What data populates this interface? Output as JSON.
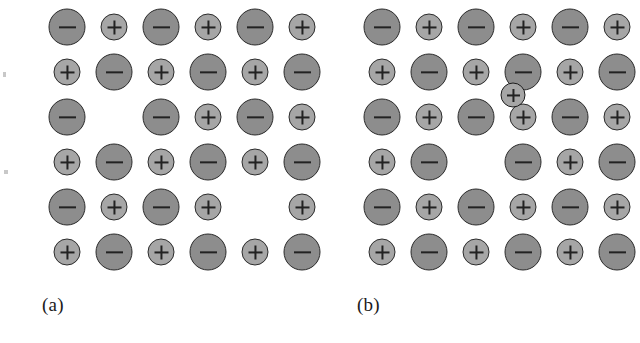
{
  "figure": {
    "background_color": "#ffffff",
    "anion_color": "#8d8d8d",
    "cation_color": "#a6a6a6",
    "outline_color": "#2b2b2b",
    "glyph_color": "#222222",
    "anion_symbol": "−",
    "cation_symbol": "+"
  },
  "panels": [
    {
      "id": "a",
      "label": "(a)",
      "columns": 6,
      "rows": 6,
      "col_step": 47,
      "row_step": 45,
      "origin_x": 31,
      "origin_y": 27,
      "rows_data": [
        [
          "-",
          "+",
          "-",
          "+",
          "-",
          "+"
        ],
        [
          "+",
          "-",
          "+",
          "-",
          "+",
          "-"
        ],
        [
          "-",
          "",
          "-",
          "+",
          "-",
          "+"
        ],
        [
          "+",
          "-",
          "+",
          "-",
          "+",
          "-"
        ],
        [
          "-",
          "+",
          "-",
          "+",
          "",
          "+"
        ],
        [
          "+",
          "-",
          "+",
          "-",
          "+",
          "-"
        ]
      ],
      "vacancies": [
        {
          "row": 3,
          "col": 2,
          "missing": "+"
        },
        {
          "row": 5,
          "col": 5,
          "missing": "-"
        }
      ],
      "interstitials": []
    },
    {
      "id": "b",
      "label": "(b)",
      "columns": 6,
      "rows": 6,
      "col_step": 47,
      "row_step": 45,
      "origin_x": 31,
      "origin_y": 27,
      "rows_data": [
        [
          "-",
          "+",
          "-",
          "+",
          "-",
          "+"
        ],
        [
          "+",
          "-",
          "+",
          "-",
          "+",
          "-"
        ],
        [
          "-",
          "+",
          "-",
          "+",
          "-",
          "+"
        ],
        [
          "+",
          "-",
          "",
          "-",
          "+",
          "-"
        ],
        [
          "-",
          "+",
          "-",
          "+",
          "-",
          "+"
        ],
        [
          "+",
          "-",
          "+",
          "-",
          "+",
          "-"
        ]
      ],
      "vacancies": [
        {
          "row": 4,
          "col": 3,
          "missing": "+"
        }
      ],
      "interstitials": [
        {
          "symbol": "+",
          "x": 162,
          "y": 95
        }
      ]
    }
  ],
  "speckles": [
    {
      "x": 3,
      "y": 72,
      "w": 3,
      "h": 5
    },
    {
      "x": 4,
      "y": 170,
      "w": 4,
      "h": 4
    }
  ]
}
